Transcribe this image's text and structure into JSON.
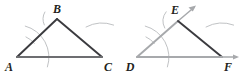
{
  "figure": {
    "background_color": "#ffffff",
    "width": 241,
    "height": 75,
    "colors": {
      "dark_stroke": "#3b3b3f",
      "medium_stroke": "#6d6e71",
      "light_stroke": "#a7a9ac",
      "arc_stroke": "#b9bbbd",
      "label_fill": "#231f20"
    },
    "panels": [
      {
        "id": "left-panel",
        "name": "triangle-abc",
        "caption": "",
        "vertices": [
          {
            "id": "A",
            "label": "A",
            "x": 17,
            "y": 57,
            "label_x": 9,
            "label_y": 71
          },
          {
            "id": "B",
            "label": "B",
            "x": 57,
            "y": 19,
            "label_x": 57,
            "label_y": 13
          },
          {
            "id": "C",
            "label": "C",
            "x": 102,
            "y": 57,
            "label_x": 105,
            "label_y": 71
          }
        ],
        "segments": [
          {
            "name": "segment-AB",
            "from": "A",
            "to": "B",
            "shade": "dark"
          },
          {
            "name": "segment-BC",
            "from": "B",
            "to": "C",
            "shade": "dark"
          },
          {
            "name": "segment-AC",
            "from": "A",
            "to": "C",
            "shade": "medium"
          }
        ],
        "arcs": [
          {
            "name": "arc-at-A-angle",
            "cx": 17,
            "cy": 57,
            "r": 32,
            "start_deg": -75,
            "end_deg": 18
          },
          {
            "name": "arc-tick-at-A",
            "cx": 17,
            "cy": 57,
            "r": 22,
            "start_deg": -66,
            "end_deg": -38
          },
          {
            "name": "arc-near-B",
            "cx": 57,
            "cy": 19,
            "r": 14,
            "start_deg": 150,
            "end_deg": 205
          },
          {
            "name": "arc-near-C",
            "cx": 102,
            "cy": 57,
            "r": 34,
            "start_deg": -118,
            "end_deg": -70
          }
        ]
      },
      {
        "id": "right-panel",
        "name": "copied-angle-def",
        "caption": "",
        "vertices": [
          {
            "id": "D",
            "label": "D",
            "x": 137,
            "y": 57,
            "label_x": 129,
            "label_y": 71
          },
          {
            "id": "E",
            "label": "E",
            "x": 178,
            "y": 21,
            "label_x": 174,
            "label_y": 14
          },
          {
            "id": "F",
            "label": "F",
            "x": 222,
            "y": 57,
            "label_x": 226,
            "label_y": 71
          }
        ],
        "segments": [
          {
            "name": "ray-DE",
            "from": "D",
            "to": "E",
            "shade": "light"
          },
          {
            "name": "segment-EF",
            "from": "E",
            "to": "F",
            "shade": "dark"
          },
          {
            "name": "ray-DF",
            "from": "D",
            "to": "F",
            "shade": "light"
          }
        ],
        "rays": [
          {
            "name": "ray-arrow-DE",
            "from_x": 178,
            "from_y": 21,
            "to_x": 196,
            "to_y": 6
          },
          {
            "name": "ray-arrow-DF",
            "from_x": 222,
            "from_y": 57,
            "to_x": 239,
            "to_y": 57
          }
        ],
        "arcs": [
          {
            "name": "arc-at-D-angle",
            "cx": 137,
            "cy": 57,
            "r": 32,
            "start_deg": -75,
            "end_deg": 18
          },
          {
            "name": "arc-tick-at-D",
            "cx": 137,
            "cy": 57,
            "r": 22,
            "start_deg": -66,
            "end_deg": -38
          },
          {
            "name": "arc-near-E",
            "cx": 178,
            "cy": 21,
            "r": 15,
            "start_deg": 142,
            "end_deg": 208
          },
          {
            "name": "arc-near-F",
            "cx": 222,
            "cy": 57,
            "r": 34,
            "start_deg": -118,
            "end_deg": -70
          }
        ]
      }
    ]
  }
}
